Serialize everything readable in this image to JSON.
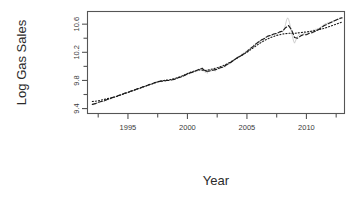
{
  "chart_data": {
    "type": "line",
    "title": "",
    "xlabel": "Year",
    "ylabel": "Log Gas Sales",
    "xlim": [
      1991.6,
      2013.2
    ],
    "ylim": [
      9.33,
      10.78
    ],
    "grid": false,
    "legend": null,
    "xticks": [
      1995,
      2000,
      2005,
      2010
    ],
    "xtick_labels": [
      "1995",
      "2000",
      "2005",
      "2010"
    ],
    "xminor_ticks": [
      1992.5,
      1997.5,
      2002.5,
      2007.5,
      2012.5
    ],
    "yticks": [
      9.4,
      9.8,
      10.2,
      10.6
    ],
    "ytick_labels": [
      "9.4",
      "9.8",
      "10.2",
      "10.6"
    ],
    "yminor_ticks": [
      9.6,
      10.0,
      10.4
    ],
    "colors": {
      "observed": "#c9c9c9",
      "fitted_dashed": "#1a1a1a",
      "fitted_dotted": "#1a1a1a",
      "axis": "#555555",
      "text": "#2b2b2b"
    },
    "series": [
      {
        "name": "observed",
        "style": "solid",
        "color": "#c9c9c9",
        "width": 0.9,
        "x": [
          1992.0,
          1992.08,
          1992.17,
          1992.25,
          1992.33,
          1992.42,
          1992.5,
          1992.58,
          1992.67,
          1992.75,
          1992.83,
          1992.92,
          1993.0,
          1993.08,
          1993.17,
          1993.25,
          1993.33,
          1993.42,
          1993.5,
          1993.58,
          1993.67,
          1993.75,
          1993.83,
          1993.92,
          1994.0,
          1994.08,
          1994.17,
          1994.25,
          1994.33,
          1994.42,
          1994.5,
          1994.58,
          1994.67,
          1994.75,
          1994.83,
          1994.92,
          1995.0,
          1995.08,
          1995.17,
          1995.25,
          1995.33,
          1995.42,
          1995.5,
          1995.58,
          1995.67,
          1995.75,
          1995.83,
          1995.92,
          1996.0,
          1996.08,
          1996.17,
          1996.25,
          1996.33,
          1996.42,
          1996.5,
          1996.58,
          1996.67,
          1996.75,
          1996.83,
          1996.92,
          1997.0,
          1997.08,
          1997.17,
          1997.25,
          1997.33,
          1997.42,
          1997.5,
          1997.58,
          1997.67,
          1997.75,
          1997.83,
          1997.92,
          1998.0,
          1998.08,
          1998.17,
          1998.25,
          1998.33,
          1998.42,
          1998.5,
          1998.58,
          1998.67,
          1998.75,
          1998.83,
          1998.92,
          1999.0,
          1999.08,
          1999.17,
          1999.25,
          1999.33,
          1999.42,
          1999.5,
          1999.58,
          1999.67,
          1999.75,
          1999.83,
          1999.92,
          2000.0,
          2000.08,
          2000.17,
          2000.25,
          2000.33,
          2000.42,
          2000.5,
          2000.58,
          2000.67,
          2000.75,
          2000.83,
          2000.92,
          2001.0,
          2001.08,
          2001.17,
          2001.25,
          2001.33,
          2001.42,
          2001.5,
          2001.58,
          2001.67,
          2001.75,
          2001.83,
          2001.92,
          2002.0,
          2002.08,
          2002.17,
          2002.25,
          2002.33,
          2002.42,
          2002.5,
          2002.58,
          2002.67,
          2002.75,
          2002.83,
          2002.92,
          2003.0,
          2003.08,
          2003.17,
          2003.25,
          2003.33,
          2003.42,
          2003.5,
          2003.58,
          2003.67,
          2003.75,
          2003.83,
          2003.92,
          2004.0,
          2004.08,
          2004.17,
          2004.25,
          2004.33,
          2004.42,
          2004.5,
          2004.58,
          2004.67,
          2004.75,
          2004.83,
          2004.92,
          2005.0,
          2005.08,
          2005.17,
          2005.25,
          2005.33,
          2005.42,
          2005.5,
          2005.58,
          2005.67,
          2005.75,
          2005.83,
          2005.92,
          2006.0,
          2006.08,
          2006.17,
          2006.25,
          2006.33,
          2006.42,
          2006.5,
          2006.58,
          2006.67,
          2006.75,
          2006.83,
          2006.92,
          2007.0,
          2007.08,
          2007.17,
          2007.25,
          2007.33,
          2007.42,
          2007.5,
          2007.58,
          2007.67,
          2007.75,
          2007.83,
          2007.92,
          2008.0,
          2008.08,
          2008.17,
          2008.25,
          2008.33,
          2008.42,
          2008.5,
          2008.58,
          2008.67,
          2008.75,
          2008.83,
          2008.92,
          2009.0,
          2009.08,
          2009.17,
          2009.25,
          2009.33,
          2009.42,
          2009.5,
          2009.58,
          2009.67,
          2009.75,
          2009.83,
          2009.92,
          2010.0,
          2010.08,
          2010.17,
          2010.25,
          2010.33,
          2010.42,
          2010.5,
          2010.58,
          2010.67,
          2010.75,
          2010.83,
          2010.92,
          2011.0,
          2011.08,
          2011.17,
          2011.25,
          2011.33,
          2011.42,
          2011.5,
          2011.58,
          2011.67,
          2011.75,
          2011.83,
          2011.92,
          2012.0,
          2012.08,
          2012.17,
          2012.25,
          2012.33,
          2012.42,
          2012.5,
          2012.58,
          2012.67,
          2012.75,
          2012.83,
          2012.92,
          2013.0
        ],
        "y": [
          9.46,
          9.45,
          9.47,
          9.46,
          9.48,
          9.47,
          9.49,
          9.48,
          9.5,
          9.49,
          9.51,
          9.5,
          9.5,
          9.52,
          9.51,
          9.53,
          9.52,
          9.54,
          9.53,
          9.55,
          9.54,
          9.56,
          9.55,
          9.57,
          9.56,
          9.58,
          9.57,
          9.59,
          9.58,
          9.6,
          9.59,
          9.61,
          9.6,
          9.62,
          9.61,
          9.63,
          9.62,
          9.64,
          9.63,
          9.65,
          9.64,
          9.66,
          9.65,
          9.67,
          9.66,
          9.68,
          9.67,
          9.69,
          9.68,
          9.7,
          9.69,
          9.71,
          9.7,
          9.72,
          9.71,
          9.73,
          9.72,
          9.74,
          9.73,
          9.75,
          9.74,
          9.76,
          9.75,
          9.77,
          9.76,
          9.78,
          9.77,
          9.79,
          9.78,
          9.79,
          9.78,
          9.8,
          9.79,
          9.8,
          9.79,
          9.81,
          9.8,
          9.81,
          9.8,
          9.82,
          9.81,
          9.82,
          9.81,
          9.83,
          9.82,
          9.84,
          9.83,
          9.85,
          9.84,
          9.86,
          9.85,
          9.87,
          9.86,
          9.88,
          9.87,
          9.89,
          9.88,
          9.9,
          9.89,
          9.91,
          9.9,
          9.92,
          9.91,
          9.93,
          9.92,
          9.94,
          9.93,
          9.95,
          9.94,
          9.97,
          9.95,
          9.99,
          9.93,
          9.96,
          9.91,
          9.95,
          9.9,
          9.94,
          9.92,
          9.95,
          9.93,
          9.96,
          9.94,
          9.95,
          9.93,
          9.96,
          9.95,
          9.97,
          9.96,
          9.98,
          9.97,
          9.99,
          9.98,
          10.0,
          9.99,
          10.02,
          10.01,
          10.04,
          10.03,
          10.06,
          10.05,
          10.08,
          10.07,
          10.1,
          10.09,
          10.12,
          10.11,
          10.14,
          10.13,
          10.16,
          10.15,
          10.18,
          10.17,
          10.2,
          10.19,
          10.22,
          10.21,
          10.24,
          10.23,
          10.26,
          10.25,
          10.28,
          10.27,
          10.31,
          10.29,
          10.33,
          10.31,
          10.35,
          10.33,
          10.37,
          10.35,
          10.39,
          10.37,
          10.4,
          10.39,
          10.42,
          10.41,
          10.43,
          10.42,
          10.44,
          10.43,
          10.45,
          10.44,
          10.46,
          10.45,
          10.47,
          10.46,
          10.48,
          10.47,
          10.49,
          10.48,
          10.5,
          10.49,
          10.52,
          10.55,
          10.6,
          10.66,
          10.69,
          10.67,
          10.62,
          10.55,
          10.48,
          10.42,
          10.36,
          10.33,
          10.36,
          10.4,
          10.43,
          10.44,
          10.45,
          10.44,
          10.46,
          10.45,
          10.47,
          10.46,
          10.48,
          10.47,
          10.49,
          10.48,
          10.5,
          10.49,
          10.51,
          10.5,
          10.52,
          10.51,
          10.53,
          10.52,
          10.54,
          10.53,
          10.55,
          10.54,
          10.57,
          10.56,
          10.59,
          10.58,
          10.61,
          10.6,
          10.62,
          10.61,
          10.63,
          10.62,
          10.64,
          10.63,
          10.65,
          10.64,
          10.66,
          10.65,
          10.67,
          10.66,
          10.68,
          10.67,
          10.69,
          10.68
        ]
      },
      {
        "name": "fitted-dashed",
        "style": "dashed",
        "color": "#1a1a1a",
        "width": 1.1,
        "x": [
          1992.0,
          1992.25,
          1992.5,
          1992.75,
          1993.0,
          1993.25,
          1993.5,
          1993.75,
          1994.0,
          1994.25,
          1994.5,
          1994.75,
          1995.0,
          1995.25,
          1995.5,
          1995.75,
          1996.0,
          1996.25,
          1996.5,
          1996.75,
          1997.0,
          1997.25,
          1997.5,
          1997.75,
          1998.0,
          1998.25,
          1998.5,
          1998.75,
          1999.0,
          1999.25,
          1999.5,
          1999.75,
          2000.0,
          2000.25,
          2000.5,
          2000.75,
          2001.0,
          2001.25,
          2001.5,
          2001.75,
          2002.0,
          2002.25,
          2002.5,
          2002.75,
          2003.0,
          2003.25,
          2003.5,
          2003.75,
          2004.0,
          2004.25,
          2004.5,
          2004.75,
          2005.0,
          2005.25,
          2005.5,
          2005.75,
          2006.0,
          2006.25,
          2006.5,
          2006.75,
          2007.0,
          2007.25,
          2007.5,
          2007.75,
          2008.0,
          2008.25,
          2008.5,
          2008.75,
          2009.0,
          2009.25,
          2009.5,
          2009.75,
          2010.0,
          2010.25,
          2010.5,
          2010.75,
          2011.0,
          2011.25,
          2011.5,
          2011.75,
          2012.0,
          2012.25,
          2012.5,
          2012.75,
          2013.0
        ],
        "y": [
          9.46,
          9.47,
          9.49,
          9.5,
          9.51,
          9.53,
          9.54,
          9.56,
          9.57,
          9.59,
          9.6,
          9.62,
          9.63,
          9.65,
          9.66,
          9.68,
          9.69,
          9.71,
          9.72,
          9.74,
          9.75,
          9.77,
          9.78,
          9.79,
          9.79,
          9.8,
          9.8,
          9.81,
          9.82,
          9.84,
          9.85,
          9.87,
          9.89,
          9.91,
          9.92,
          9.94,
          9.96,
          9.97,
          9.93,
          9.93,
          9.94,
          9.95,
          9.96,
          9.98,
          9.99,
          10.02,
          10.04,
          10.07,
          10.1,
          10.13,
          10.15,
          10.18,
          10.21,
          10.25,
          10.28,
          10.32,
          10.35,
          10.38,
          10.4,
          10.43,
          10.44,
          10.46,
          10.47,
          10.49,
          10.5,
          10.55,
          10.58,
          10.52,
          10.41,
          10.4,
          10.43,
          10.45,
          10.45,
          10.47,
          10.48,
          10.5,
          10.52,
          10.55,
          10.58,
          10.6,
          10.62,
          10.64,
          10.66,
          10.68,
          10.69
        ]
      },
      {
        "name": "fitted-dotted",
        "style": "dotted",
        "color": "#1a1a1a",
        "width": 1.1,
        "x": [
          1992.0,
          1992.5,
          1993.0,
          1993.5,
          1994.0,
          1994.5,
          1995.0,
          1995.5,
          1996.0,
          1996.5,
          1997.0,
          1997.5,
          1998.0,
          1998.5,
          1999.0,
          1999.5,
          2000.0,
          2000.5,
          2001.0,
          2001.5,
          2002.0,
          2002.5,
          2003.0,
          2003.5,
          2004.0,
          2004.5,
          2005.0,
          2005.5,
          2006.0,
          2006.5,
          2007.0,
          2007.5,
          2008.0,
          2008.5,
          2009.0,
          2009.5,
          2010.0,
          2010.5,
          2011.0,
          2011.5,
          2012.0,
          2012.5,
          2013.0
        ],
        "y": [
          9.5,
          9.51,
          9.53,
          9.55,
          9.57,
          9.6,
          9.63,
          9.66,
          9.69,
          9.72,
          9.75,
          9.78,
          9.8,
          9.81,
          9.83,
          9.86,
          9.9,
          9.93,
          9.95,
          9.94,
          9.96,
          9.98,
          10.01,
          10.05,
          10.1,
          10.15,
          10.2,
          10.26,
          10.32,
          10.37,
          10.41,
          10.44,
          10.46,
          10.47,
          10.47,
          10.48,
          10.49,
          10.5,
          10.52,
          10.54,
          10.57,
          10.6,
          10.63
        ]
      }
    ]
  }
}
